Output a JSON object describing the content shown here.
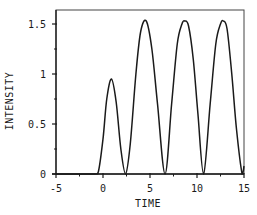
{
  "chart_data": {
    "type": "line",
    "title": "",
    "xlabel": "TIME",
    "ylabel": "INTENSITY",
    "xlim": [
      -5,
      15
    ],
    "ylim": [
      0,
      1.64
    ],
    "grid": false,
    "legend": null,
    "x_ticks": [
      -5,
      0,
      5,
      10,
      15
    ],
    "x_tick_labels": [
      "-5",
      "0",
      "5",
      "10",
      "15"
    ],
    "y_ticks": [
      0,
      0.5,
      1,
      1.5
    ],
    "y_tick_labels": [
      "0",
      "0.5",
      "1",
      "1.5"
    ],
    "series": [
      {
        "name": "intensity",
        "color": "#1a1a1a",
        "x": [
          -5,
          -1,
          -0.5,
          0,
          0.4,
          0.9,
          1.4,
          1.9,
          2.4,
          2.9,
          3.5,
          4.0,
          4.6,
          5.2,
          5.8,
          6.6,
          7.3,
          7.9,
          8.4,
          8.7,
          9.1,
          9.6,
          10.1,
          10.7,
          11.4,
          12.0,
          12.5,
          12.8,
          13.2,
          13.7,
          14.2,
          14.8,
          15.0
        ],
        "values": [
          0,
          0,
          0.02,
          0.35,
          0.75,
          0.95,
          0.72,
          0.25,
          0,
          0.3,
          1.0,
          1.42,
          1.53,
          1.25,
          0.7,
          0,
          0.7,
          1.3,
          1.5,
          1.53,
          1.48,
          1.15,
          0.6,
          0,
          0.7,
          1.3,
          1.5,
          1.53,
          1.45,
          1.0,
          0.45,
          0,
          0.08
        ]
      }
    ],
    "peaks": [
      {
        "x": 0.9,
        "y": 0.95
      },
      {
        "x": 4.6,
        "y": 1.53
      },
      {
        "x": 8.7,
        "y": 1.53
      },
      {
        "x": 12.8,
        "y": 1.53
      }
    ]
  }
}
